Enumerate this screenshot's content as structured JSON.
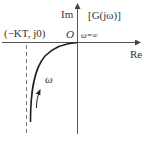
{
  "diagram": {
    "type": "nyquist-plot",
    "axes": {
      "real_label": "Re",
      "imag_label": "Im"
    },
    "plane_label": "[G(jω)]",
    "origin_label": "O",
    "omega_infinity_label": "ω=∞",
    "asymptote_label": "(−KT, j0)",
    "direction_label": "ω",
    "colors": {
      "axis": "#555555",
      "curve": "#222222",
      "asymptote": "#777777",
      "text": "#333333"
    }
  }
}
